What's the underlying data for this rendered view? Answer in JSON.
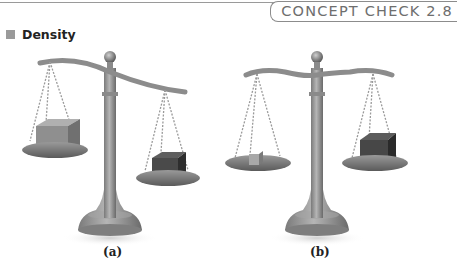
{
  "header": {
    "concept_check": "CONCEPT CHECK 2.8"
  },
  "section": {
    "title": "Density",
    "bullet_color": "#9a9a9a"
  },
  "figure": {
    "panels": [
      {
        "label": "(a)",
        "beam": "tilted",
        "left_pan": {
          "object": "larger light cube",
          "position": "higher"
        },
        "right_pan": {
          "object": "smaller dark cube",
          "position": "lower"
        }
      },
      {
        "label": "(b)",
        "beam": "level",
        "left_pan": {
          "object": "small light cube",
          "position": "level"
        },
        "right_pan": {
          "object": "larger dark cube",
          "position": "level"
        }
      }
    ]
  }
}
